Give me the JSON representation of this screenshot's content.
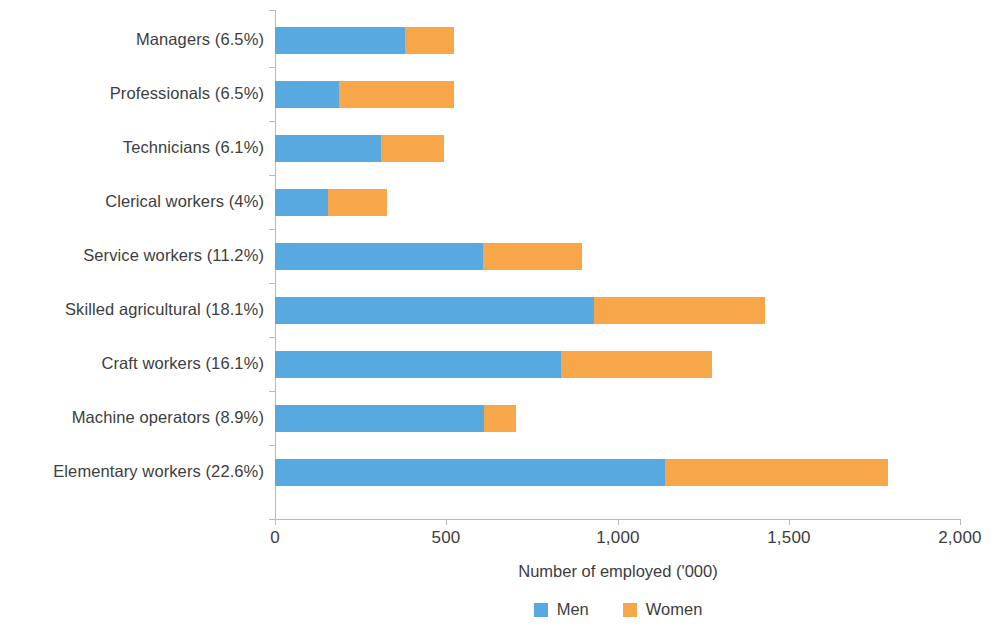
{
  "chart_data": {
    "type": "bar",
    "orientation": "horizontal",
    "stacked": true,
    "title": "",
    "xlabel": "Number of employed  ('000)",
    "ylabel": "",
    "xlim": [
      0,
      2000
    ],
    "xticks": [
      "0",
      "500",
      "1,000",
      "1,500",
      "2,000"
    ],
    "grid": false,
    "legend_position": "bottom",
    "categories": [
      "Managers (6.5%)",
      "Professionals (6.5%)",
      "Technicians (6.1%)",
      "Clerical workers (4%)",
      "Service workers (11.2%)",
      "Skilled agricultural (18.1%)",
      "Craft workers (16.1%)",
      "Machine operators (8.9%)",
      "Elementary workers (22.6%)"
    ],
    "series": [
      {
        "name": "Men",
        "color": "#57a9e0",
        "values": [
          380,
          187,
          310,
          155,
          607,
          931,
          835,
          610,
          1140
        ]
      },
      {
        "name": "Women",
        "color": "#f7a74a",
        "values": [
          143,
          336,
          183,
          172,
          289,
          499,
          441,
          94,
          650
        ]
      }
    ],
    "totals": [
      523,
      523,
      493,
      327,
      896,
      1430,
      1276,
      704,
      1790
    ]
  },
  "axis": {
    "x_title": "Number of employed  ('000)",
    "ticks": [
      "0",
      "500",
      "1,000",
      "1,500",
      "2,000"
    ]
  },
  "legend": {
    "items": [
      {
        "label": "Men",
        "color": "#57a9e0"
      },
      {
        "label": "Women",
        "color": "#f7a74a"
      }
    ]
  }
}
